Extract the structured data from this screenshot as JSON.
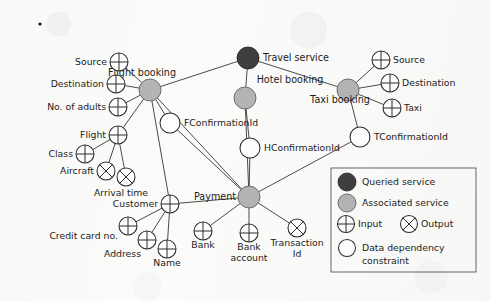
{
  "diagram": {
    "colors": {
      "queried_service": "#3f3f3f",
      "associated_service": "#b4b4b4",
      "node_outline": "#2b2b2b",
      "edge": "#2b2b2b",
      "background": "#fbfbf9"
    },
    "services": [
      {
        "id": "travel",
        "label": "Travel service",
        "kind": "queried",
        "cx": 248,
        "cy": 58,
        "r": 11,
        "label_x": 263,
        "label_y": 61,
        "anchor": "start"
      },
      {
        "id": "flight",
        "label": "Flight booking",
        "kind": "associated",
        "cx": 150,
        "cy": 90,
        "r": 11,
        "label_x": 142,
        "label_y": 76,
        "anchor": "middle"
      },
      {
        "id": "hotel",
        "label": "Hotel booking",
        "kind": "associated",
        "cx": 245,
        "cy": 98,
        "r": 11,
        "label_x": 290,
        "label_y": 83,
        "anchor": "middle"
      },
      {
        "id": "taxi",
        "label": "Taxi booking",
        "kind": "associated",
        "cx": 348,
        "cy": 90,
        "r": 11,
        "label_x": 340,
        "label_y": 103,
        "anchor": "middle"
      },
      {
        "id": "payment",
        "label": "Payment",
        "kind": "associated",
        "cx": 249,
        "cy": 197,
        "r": 11,
        "label_x": 236,
        "label_y": 200,
        "anchor": "end"
      }
    ],
    "params": [
      {
        "id": "f_source",
        "label": "Source",
        "kind": "input",
        "cx": 119,
        "cy": 62,
        "r": 9,
        "label_x": 107,
        "label_y": 65,
        "anchor": "end"
      },
      {
        "id": "f_dest",
        "label": "Destination",
        "kind": "input",
        "cx": 116,
        "cy": 84,
        "r": 9,
        "label_x": 104,
        "label_y": 87,
        "anchor": "end"
      },
      {
        "id": "f_adults",
        "label": "No. of adults",
        "kind": "input",
        "cx": 118,
        "cy": 107,
        "r": 9,
        "label_x": 106,
        "label_y": 110,
        "anchor": "end"
      },
      {
        "id": "f_flight",
        "label": "Flight",
        "kind": "input",
        "cx": 118,
        "cy": 135,
        "r": 9,
        "label_x": 106,
        "label_y": 138,
        "anchor": "end"
      },
      {
        "id": "f_class",
        "label": "Class",
        "kind": "input",
        "cx": 85,
        "cy": 154,
        "r": 9,
        "label_x": 73,
        "label_y": 157,
        "anchor": "end"
      },
      {
        "id": "f_aircraft",
        "label": "Aircraft",
        "kind": "output",
        "cx": 106,
        "cy": 171,
        "r": 9,
        "label_x": 94,
        "label_y": 174,
        "anchor": "end"
      },
      {
        "id": "f_arrival",
        "label": "Arrival time",
        "kind": "output",
        "cx": 126,
        "cy": 177,
        "r": 9,
        "label_x": 121,
        "label_y": 196,
        "anchor": "middle"
      },
      {
        "id": "customer",
        "label": "Customer",
        "kind": "input",
        "cx": 170,
        "cy": 204,
        "r": 9,
        "label_x": 158,
        "label_y": 207,
        "anchor": "end"
      },
      {
        "id": "credit_card",
        "label": "Credit card no.",
        "kind": "input",
        "cx": 128,
        "cy": 226,
        "r": 9,
        "label_x": 118,
        "label_y": 239,
        "anchor": "end"
      },
      {
        "id": "address",
        "label": "Address",
        "kind": "input",
        "cx": 147,
        "cy": 240,
        "r": 9,
        "label_x": 141,
        "label_y": 257,
        "anchor": "end"
      },
      {
        "id": "name",
        "label": "Name",
        "kind": "input",
        "cx": 167,
        "cy": 249,
        "r": 9,
        "label_x": 167,
        "label_y": 266,
        "anchor": "middle"
      },
      {
        "id": "p_bank",
        "label": "Bank",
        "kind": "input",
        "cx": 203,
        "cy": 231,
        "r": 9,
        "label_x": 203,
        "label_y": 248,
        "anchor": "middle"
      },
      {
        "id": "p_account",
        "label": "Bank\naccount",
        "kind": "input",
        "cx": 249,
        "cy": 233,
        "r": 9,
        "label_x": 249,
        "label_y": 250,
        "anchor": "middle"
      },
      {
        "id": "p_trans",
        "label": "Transaction\nId",
        "kind": "output",
        "cx": 297,
        "cy": 228,
        "r": 9,
        "label_x": 297,
        "label_y": 246,
        "anchor": "middle"
      },
      {
        "id": "t_source",
        "label": "Source",
        "kind": "input",
        "cx": 381,
        "cy": 60,
        "r": 9,
        "label_x": 393,
        "label_y": 63,
        "anchor": "start"
      },
      {
        "id": "t_dest",
        "label": "Destination",
        "kind": "input",
        "cx": 390,
        "cy": 83,
        "r": 9,
        "label_x": 402,
        "label_y": 86,
        "anchor": "start"
      },
      {
        "id": "t_taxi",
        "label": "Taxi",
        "kind": "input",
        "cx": 392,
        "cy": 108,
        "r": 9,
        "label_x": 404,
        "label_y": 111,
        "anchor": "start"
      }
    ],
    "constraints": [
      {
        "id": "fconf",
        "label": "FConfirmationId",
        "cx": 170,
        "cy": 123,
        "r": 10,
        "label_x": 184,
        "label_y": 126,
        "anchor": "start"
      },
      {
        "id": "hconf",
        "label": "HConfirmationId",
        "cx": 250,
        "cy": 148,
        "r": 10,
        "label_x": 264,
        "label_y": 151,
        "anchor": "start"
      },
      {
        "id": "tconf",
        "label": "TConfirmationId",
        "cx": 360,
        "cy": 137,
        "r": 10,
        "label_x": 374,
        "label_y": 140,
        "anchor": "start"
      }
    ],
    "edges": [
      {
        "from": "travel",
        "to": "flight"
      },
      {
        "from": "travel",
        "to": "hotel"
      },
      {
        "from": "travel",
        "to": "taxi"
      },
      {
        "from": "flight",
        "to": "f_source"
      },
      {
        "from": "flight",
        "to": "f_dest"
      },
      {
        "from": "flight",
        "to": "f_adults"
      },
      {
        "from": "flight",
        "to": "f_flight"
      },
      {
        "from": "flight",
        "to": "fconf"
      },
      {
        "from": "flight",
        "to": "customer"
      },
      {
        "from": "flight",
        "to": "payment"
      },
      {
        "from": "f_flight",
        "to": "f_class"
      },
      {
        "from": "f_flight",
        "to": "f_aircraft"
      },
      {
        "from": "f_flight",
        "to": "f_arrival"
      },
      {
        "from": "hotel",
        "to": "hconf"
      },
      {
        "from": "hconf",
        "to": "payment"
      },
      {
        "from": "hotel",
        "to": "payment"
      },
      {
        "from": "taxi",
        "to": "t_source"
      },
      {
        "from": "taxi",
        "to": "t_dest"
      },
      {
        "from": "taxi",
        "to": "t_taxi"
      },
      {
        "from": "taxi",
        "to": "tconf"
      },
      {
        "from": "tconf",
        "to": "payment"
      },
      {
        "from": "fconf",
        "to": "payment"
      },
      {
        "from": "customer",
        "to": "credit_card"
      },
      {
        "from": "customer",
        "to": "address"
      },
      {
        "from": "customer",
        "to": "name"
      },
      {
        "from": "customer",
        "to": "payment"
      },
      {
        "from": "payment",
        "to": "p_bank"
      },
      {
        "from": "payment",
        "to": "p_account"
      },
      {
        "from": "payment",
        "to": "p_trans"
      }
    ]
  },
  "legend": {
    "box": {
      "x": 331,
      "y": 168,
      "width": 145,
      "height": 104
    },
    "items": [
      {
        "id": "queried",
        "symbol": "filled-dark-circle",
        "label": "Queried service",
        "cx": 347,
        "cy": 182,
        "label_x": 362,
        "label_y": 185
      },
      {
        "id": "associated",
        "symbol": "filled-gray-circle",
        "label": "Associated service",
        "cx": 347,
        "cy": 203,
        "label_x": 362,
        "label_y": 206
      },
      {
        "id": "input",
        "symbol": "crossed-plus-circle",
        "label": "Input",
        "cx": 346,
        "cy": 224,
        "label_x": 358,
        "label_y": 227
      },
      {
        "id": "output",
        "symbol": "crossed-x-circle",
        "label": "Output",
        "cx": 409,
        "cy": 224,
        "label_x": 421,
        "label_y": 227
      },
      {
        "id": "constraint",
        "symbol": "empty-circle",
        "label": "Data dependency",
        "cx": 347,
        "cy": 248,
        "label_x": 362,
        "label_y": 251
      }
    ],
    "constraint_line2": {
      "label": "constraint",
      "x": 362,
      "y": 264
    }
  },
  "artifacts": {
    "speck": {
      "cx": 40,
      "cy": 24,
      "r": 1.6
    }
  }
}
